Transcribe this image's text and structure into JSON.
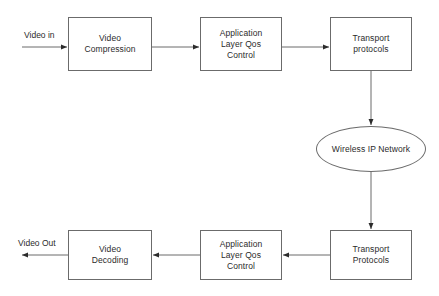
{
  "diagram": {
    "background_color": "#ffffff",
    "line_color": "#6b6b6b",
    "text_color": "#2b2b2b",
    "nodes": [
      {
        "id": "video_compression",
        "label": "Video\nCompression",
        "shape": "rect",
        "x": 68,
        "y": 17,
        "w": 84,
        "h": 54
      },
      {
        "id": "app_layer_qos_top",
        "label": "Application\nLayer Qos\nControl",
        "shape": "rect",
        "x": 200,
        "y": 17,
        "w": 82,
        "h": 54
      },
      {
        "id": "transport_protocols_top",
        "label": "Transport\nprotocols",
        "shape": "rect",
        "x": 330,
        "y": 17,
        "w": 82,
        "h": 54
      },
      {
        "id": "wireless_ip_network",
        "label": "Wireless IP Network",
        "shape": "ellipse",
        "x": 316,
        "y": 126,
        "w": 110,
        "h": 46
      },
      {
        "id": "transport_protocols_bottom",
        "label": "Transport\nProtocols",
        "shape": "rect",
        "x": 330,
        "y": 230,
        "w": 82,
        "h": 50
      },
      {
        "id": "app_layer_qos_bottom",
        "label": "Application\nLayer Qos\nControl",
        "shape": "rect",
        "x": 200,
        "y": 230,
        "w": 82,
        "h": 50
      },
      {
        "id": "video_decoding",
        "label": "Video\nDecoding",
        "shape": "rect",
        "x": 68,
        "y": 230,
        "w": 84,
        "h": 50
      }
    ],
    "edge_labels": [
      {
        "id": "video_in",
        "text": "Video in",
        "x": 24,
        "y": 30
      },
      {
        "id": "video_out",
        "text": "Video Out",
        "x": 18,
        "y": 238
      }
    ]
  }
}
